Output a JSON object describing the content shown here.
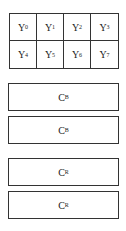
{
  "luma_grid": {
    "cells": [
      {
        "label": "Y",
        "sub": "0"
      },
      {
        "label": "Y",
        "sub": "1"
      },
      {
        "label": "Y",
        "sub": "2"
      },
      {
        "label": "Y",
        "sub": "3"
      },
      {
        "label": "Y",
        "sub": "4"
      },
      {
        "label": "Y",
        "sub": "5"
      },
      {
        "label": "Y",
        "sub": "6"
      },
      {
        "label": "Y",
        "sub": "7"
      }
    ]
  },
  "chroma_blocks": [
    {
      "label": "C",
      "sub": "B"
    },
    {
      "label": "C",
      "sub": "B"
    },
    {
      "label": "C",
      "sub": "R"
    },
    {
      "label": "C",
      "sub": "R"
    }
  ]
}
